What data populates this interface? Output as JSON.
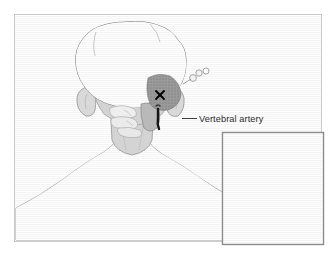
{
  "figure": {
    "background_color": "#ffffff",
    "frame": {
      "name": "illustration-border",
      "x": 14,
      "y": 14,
      "width": 308,
      "height": 228,
      "stroke_color": "#9a9a9a",
      "fill_color": "#ffffff"
    },
    "annotations": {
      "vertebral_artery_label": "Vertebral artery",
      "surgical_site_marker": "X"
    },
    "colors": {
      "hair": "#8c8c8c",
      "hair_shadow": "#7d7d7d",
      "skin": "#d9d9d9",
      "skin_shadow": "#c9c9c9",
      "bone": "#ececec",
      "bone_outline": "#a8a8a8",
      "artery": "#1a1a1a",
      "marker": "#000000",
      "outline": "#8f8f8f",
      "label": "#2b2b2b",
      "leader_line": "#3a3a3a",
      "inset_border": "#8a8a8a",
      "inset_background": "#ffffff"
    },
    "main_view": {
      "name": "posterior-head-neck-view",
      "description": "Back of head, neck and shoulders with occipital surgical site"
    },
    "inset": {
      "name": "lateral-profile-inset",
      "description": "Right lateral profile of head and neck",
      "x": 222,
      "y": 132,
      "width": 102,
      "height": 113
    }
  }
}
